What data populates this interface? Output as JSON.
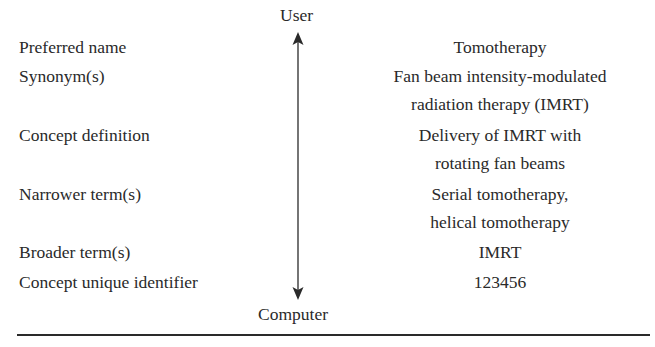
{
  "axis": {
    "top_label": "User",
    "bottom_label": "Computer"
  },
  "rows": [
    {
      "label": "Preferred name",
      "value_lines": [
        "Tomotherapy"
      ]
    },
    {
      "label": "Synonym(s)",
      "value_lines": [
        "Fan beam intensity-modulated",
        "radiation therapy (IMRT)"
      ]
    },
    {
      "label": "Concept definition",
      "value_lines": [
        "Delivery of IMRT with",
        "rotating fan beams"
      ]
    },
    {
      "label": "Narrower term(s)",
      "value_lines": [
        "Serial tomotherapy,",
        "helical tomotherapy"
      ]
    },
    {
      "label": "Broader term(s)",
      "value_lines": [
        "IMRT"
      ]
    },
    {
      "label": "Concept unique identifier",
      "value_lines": [
        "123456"
      ]
    }
  ],
  "colors": {
    "text": "#2a2a2a",
    "background": "#ffffff"
  }
}
